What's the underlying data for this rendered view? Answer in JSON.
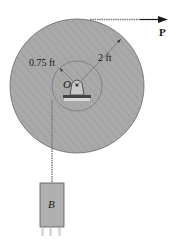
{
  "diagram": {
    "labels": {
      "force": "P",
      "outer_radius": "2 ft",
      "inner_radius": "0.75 ft",
      "pin": "O",
      "block": "B"
    },
    "colors": {
      "drum_fill": "#a9a9a9",
      "hub_fill": "#b8b8b8",
      "rope": "#7a7a7a",
      "block_fill": "#b0b0b0",
      "outline": "#555555",
      "arrow": "#1a1a1a"
    }
  }
}
